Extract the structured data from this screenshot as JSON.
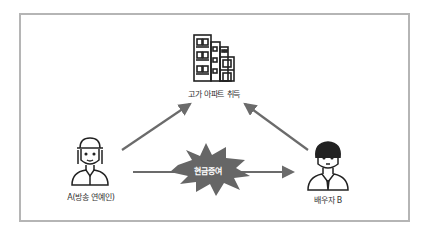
{
  "diagram": {
    "nodes": {
      "building": {
        "label": "고가 아파트 취득",
        "icon": "apartment-building-icon"
      },
      "person_a": {
        "label": "A(방송 연예인)",
        "icon": "woman-with-cap-icon"
      },
      "person_b": {
        "label": "배우자 B",
        "icon": "man-in-suit-icon"
      }
    },
    "edges": [
      {
        "from": "person_a",
        "to": "building",
        "label": ""
      },
      {
        "from": "person_b",
        "to": "building",
        "label": ""
      },
      {
        "from": "person_a",
        "to": "person_b",
        "label": "현금증여"
      }
    ],
    "colors": {
      "frame": "#b5b5b5",
      "arrow": "#6b6b6b",
      "burst": "#666666",
      "icon_stroke": "#222222"
    }
  }
}
